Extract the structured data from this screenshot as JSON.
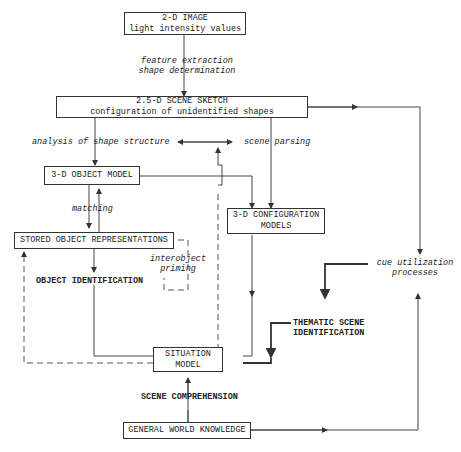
{
  "boxes": {
    "image2d": {
      "line1": "2-D IMAGE",
      "line2": "light intensity values"
    },
    "sketch25d": {
      "line1": "2.5-D SCENE SKETCH",
      "line2": "configuration of unidentified shapes"
    },
    "object3d": {
      "line1": "3-D OBJECT MODEL"
    },
    "stored": {
      "line1": "STORED OBJECT REPRESENTATIONS"
    },
    "config3d": {
      "line1": "3-D CONFIGURATION",
      "line2": "MODELS"
    },
    "situation": {
      "line1": "SITUATION",
      "line2": "MODEL"
    },
    "world": {
      "line1": "GENERAL WORLD KNOWLEDGE"
    }
  },
  "labels": {
    "feature": {
      "line1": "feature extraction",
      "line2": "shape determination"
    },
    "analysis": "analysis of shape structure",
    "parsing": "scene parsing",
    "matching": "matching",
    "priming": {
      "line1": "interobject",
      "line2": "priming"
    },
    "object_id": "OBJECT IDENTIFICATION",
    "cue": {
      "line1": "cue utilization",
      "line2": "processes"
    },
    "thematic": {
      "line1": "THEMATIC SCENE",
      "line2": "IDENTIFICATION"
    },
    "comprehension": "SCENE COMPREHENSION"
  }
}
